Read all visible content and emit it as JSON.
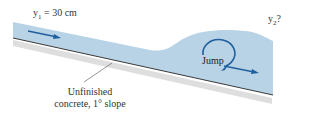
{
  "diagram": {
    "upstream_depth": {
      "var": "y",
      "sub": "1",
      "value": " = 30 cm"
    },
    "downstream_depth": {
      "var": "y",
      "sub": "2",
      "value": "?"
    },
    "jump_label": "Jump",
    "surface_label_line1": "Unfinished",
    "surface_label_line2": "concrete, 1° slope",
    "colors": {
      "water": "#b8d3e6",
      "water_edge": "#a9c7dd",
      "arrow": "#1f5f9e",
      "channel_bottom": "#3a3a3a",
      "shadow": "#cfcfcf"
    }
  }
}
